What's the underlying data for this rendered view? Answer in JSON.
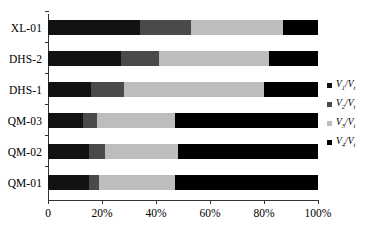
{
  "chart_data": {
    "type": "bar",
    "orientation": "horizontal",
    "stacked": true,
    "normalized": true,
    "title": "",
    "xlabel": "",
    "ylabel": "",
    "xlim": [
      0,
      100
    ],
    "grid": false,
    "legend_position": "right",
    "categories": [
      "QM-01",
      "QM-02",
      "QM-03",
      "DHS-1",
      "DHS-2",
      "XL-01"
    ],
    "categories_top_to_bottom": [
      "XL-01",
      "DHS-2",
      "DHS-1",
      "QM-03",
      "QM-02",
      "QM-01"
    ],
    "xtick_labels": [
      "0",
      "20%",
      "40%",
      "60%",
      "80%",
      "100%"
    ],
    "xtick_values": [
      0,
      20,
      40,
      60,
      80,
      100
    ],
    "series": [
      {
        "name": "V1/Vt",
        "symbol": "V",
        "subscript": "1",
        "denominator_subscript": "t",
        "color": "#121212",
        "values": [
          15,
          15,
          13,
          16,
          27,
          34
        ]
      },
      {
        "name": "V2/Vt",
        "symbol": "V",
        "subscript": "2",
        "denominator_subscript": "t",
        "color": "#4a4a4a",
        "values": [
          4,
          6,
          5,
          12,
          14,
          19
        ]
      },
      {
        "name": "V3/Vt",
        "symbol": "V",
        "subscript": "3",
        "denominator_subscript": "t",
        "color": "#bdbdbd",
        "values": [
          28,
          27,
          29,
          52,
          41,
          34
        ]
      },
      {
        "name": "V4/Vt",
        "symbol": "V",
        "subscript": "4",
        "denominator_subscript": "t",
        "color": "#000000",
        "values": [
          53,
          52,
          53,
          20,
          18,
          13
        ]
      }
    ],
    "rows_top_to_bottom": [
      {
        "category": "XL-01",
        "v1": 34,
        "v2": 19,
        "v3": 34,
        "v4": 13
      },
      {
        "category": "DHS-2",
        "v1": 27,
        "v2": 14,
        "v3": 41,
        "v4": 18
      },
      {
        "category": "DHS-1",
        "v1": 16,
        "v2": 12,
        "v3": 52,
        "v4": 20
      },
      {
        "category": "QM-03",
        "v1": 13,
        "v2": 5,
        "v3": 29,
        "v4": 53
      },
      {
        "category": "QM-02",
        "v1": 15,
        "v2": 6,
        "v3": 27,
        "v4": 52
      },
      {
        "category": "QM-01",
        "v1": 15,
        "v2": 4,
        "v3": 28,
        "v4": 53
      }
    ]
  },
  "legend": {
    "items": [
      {
        "label": "V1/Vt",
        "num_sub": "1",
        "den_sub": "t",
        "color": "#121212"
      },
      {
        "label": "V2/Vt",
        "num_sub": "2",
        "den_sub": "t",
        "color": "#4a4a4a"
      },
      {
        "label": "V3/Vt",
        "num_sub": "3",
        "den_sub": "t",
        "color": "#bdbdbd"
      },
      {
        "label": "V4/Vt",
        "num_sub": "4",
        "den_sub": "t",
        "color": "#000000"
      }
    ]
  },
  "axis": {
    "line_color": "#333333"
  }
}
